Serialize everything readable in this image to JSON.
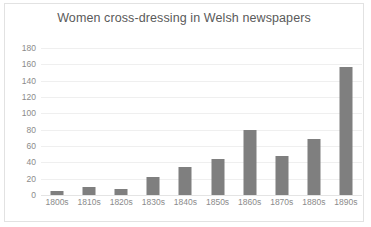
{
  "chart_data": {
    "type": "bar",
    "title": "Women cross-dressing in Welsh newspapers",
    "xlabel": "",
    "ylabel": "",
    "categories": [
      "1800s",
      "1810s",
      "1820s",
      "1830s",
      "1840s",
      "1850s",
      "1860s",
      "1870s",
      "1880s",
      "1890s"
    ],
    "values": [
      5,
      10,
      7,
      22,
      34,
      44,
      80,
      48,
      68,
      157
    ],
    "ylim": [
      0,
      180
    ],
    "ytick_step": 20,
    "yticks": [
      0,
      20,
      40,
      60,
      80,
      100,
      120,
      140,
      160,
      180
    ],
    "ytick_labels": [
      "0",
      "20",
      "40",
      "60",
      "80",
      "100",
      "120",
      "140",
      "160",
      "180"
    ],
    "grid": true,
    "legend": false,
    "legend_position": "none",
    "bar_color": "#7f7f7f",
    "gridline_color": "#efefef",
    "axis_text_color": "#8b8b8b",
    "title_color": "#5a5a5a",
    "plot_background": "#ffffff",
    "border_color": "#e2e2e2"
  }
}
